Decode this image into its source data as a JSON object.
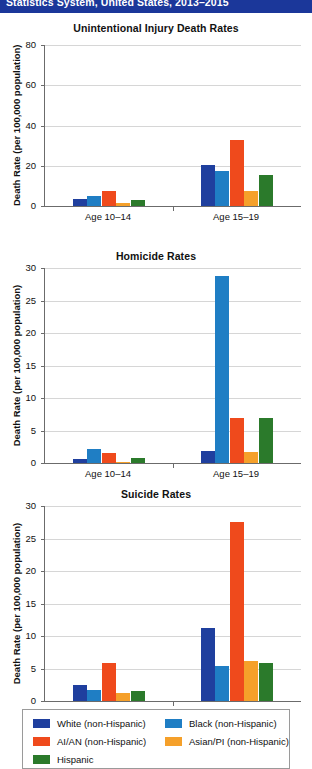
{
  "header": {
    "text": "Statistics System, United States, 2013–2015"
  },
  "legend": {
    "entries": [
      {
        "label": "White (non-Hispanic)",
        "color": "#1f3f9e"
      },
      {
        "label": "Black (non-Hispanic)",
        "color": "#1f7ec4"
      },
      {
        "label": "AI/AN (non-Hispanic)",
        "color": "#ef4a1c"
      },
      {
        "label": "Asian/PI (non-Hispanic)",
        "color": "#f5a02a"
      },
      {
        "label": "Hispanic",
        "color": "#2b7a2b"
      }
    ]
  },
  "axis": {
    "ylabel": "Death Rate (per 100,000 population)",
    "groups": [
      "Age 10–14",
      "Age 15–19"
    ]
  },
  "chart_data": [
    {
      "type": "bar",
      "title": "Unintentional Injury Death Rates",
      "xlabel": "",
      "ylabel": "Death Rate (per 100,000 population)",
      "ylim": [
        0,
        80
      ],
      "yticks": [
        0,
        20,
        40,
        60,
        80
      ],
      "grid": true,
      "legend_position": "bottom",
      "categories": [
        "Age 10–14",
        "Age 15–19"
      ],
      "series": [
        {
          "name": "White (non-Hispanic)",
          "color": "#1f3f9e",
          "values": [
            3.5,
            20.2
          ]
        },
        {
          "name": "Black (non-Hispanic)",
          "color": "#1f7ec4",
          "values": [
            4.8,
            17.2
          ]
        },
        {
          "name": "AI/AN (non-Hispanic)",
          "color": "#ef4a1c",
          "values": [
            7.3,
            32.8
          ]
        },
        {
          "name": "Asian/PI (non-Hispanic)",
          "color": "#f5a02a",
          "values": [
            1.7,
            7.4
          ]
        },
        {
          "name": "Hispanic",
          "color": "#2b7a2b",
          "values": [
            3.1,
            15.3
          ]
        }
      ]
    },
    {
      "type": "bar",
      "title": "Homicide Rates",
      "xlabel": "",
      "ylabel": "Death Rate (per 100,000 population)",
      "ylim": [
        0,
        30
      ],
      "yticks": [
        0,
        5,
        10,
        15,
        20,
        25,
        30
      ],
      "grid": true,
      "legend_position": "bottom",
      "categories": [
        "Age 10–14",
        "Age 15–19"
      ],
      "series": [
        {
          "name": "White (non-Hispanic)",
          "color": "#1f3f9e",
          "values": [
            0.6,
            1.9
          ]
        },
        {
          "name": "Black (non-Hispanic)",
          "color": "#1f7ec4",
          "values": [
            2.1,
            28.8
          ]
        },
        {
          "name": "AI/AN (non-Hispanic)",
          "color": "#ef4a1c",
          "values": [
            1.5,
            6.9
          ]
        },
        {
          "name": "Asian/PI (non-Hispanic)",
          "color": "#f5a02a",
          "values": [
            0.2,
            1.7
          ]
        },
        {
          "name": "Hispanic",
          "color": "#2b7a2b",
          "values": [
            0.7,
            7.0
          ]
        }
      ]
    },
    {
      "type": "bar",
      "title": "Suicide Rates",
      "xlabel": "",
      "ylabel": "Death Rate (per 100,000 population)",
      "ylim": [
        0,
        30
      ],
      "yticks": [
        0,
        5,
        10,
        15,
        20,
        25,
        30
      ],
      "grid": true,
      "legend_position": "bottom",
      "categories": [
        "Age 10–14",
        "Age 15–19"
      ],
      "series": [
        {
          "name": "White (non-Hispanic)",
          "color": "#1f3f9e",
          "values": [
            2.4,
            11.2
          ]
        },
        {
          "name": "Black (non-Hispanic)",
          "color": "#1f7ec4",
          "values": [
            1.7,
            5.4
          ]
        },
        {
          "name": "AI/AN (non-Hispanic)",
          "color": "#ef4a1c",
          "values": [
            5.9,
            27.5
          ]
        },
        {
          "name": "Asian/PI (non-Hispanic)",
          "color": "#f5a02a",
          "values": [
            1.3,
            6.1
          ]
        },
        {
          "name": "Hispanic",
          "color": "#2b7a2b",
          "values": [
            1.5,
            5.9
          ]
        }
      ]
    }
  ]
}
